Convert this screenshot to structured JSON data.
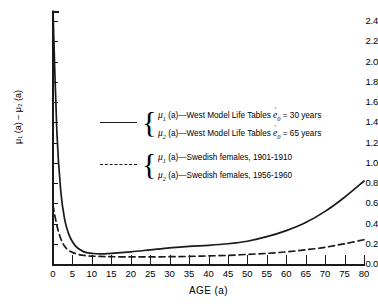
{
  "chart_data": {
    "type": "line",
    "title": "",
    "xlabel": "AGE (a)",
    "ylabel": "μ₁ (a) – μ₂ (a)",
    "xlim": [
      0,
      80
    ],
    "ylim": [
      0.0,
      2.5
    ],
    "grid": false,
    "legend_position": "upper-center",
    "xticks": [
      "0",
      "5",
      "10",
      "15",
      "20",
      "25",
      "30",
      "35",
      "40",
      "45",
      "50",
      "55",
      "60",
      "65",
      "70",
      "75",
      "80"
    ],
    "yticks": [
      "0.0",
      "0.2",
      "0.4",
      "0.6",
      "0.8",
      "1.0",
      "1.2",
      "1.4",
      "1.6",
      "1.8",
      "2.0",
      "2.2",
      "2.4"
    ],
    "series": [
      {
        "name": "West Model Life Tables",
        "style": "solid",
        "x": [
          0,
          1,
          2,
          3,
          4,
          5,
          6,
          7,
          8,
          9,
          10,
          12,
          15,
          20,
          25,
          30,
          35,
          40,
          45,
          50,
          55,
          60,
          65,
          70,
          75,
          80
        ],
        "values": [
          2.5,
          1.3,
          0.72,
          0.44,
          0.3,
          0.22,
          0.17,
          0.14,
          0.12,
          0.11,
          0.105,
          0.1,
          0.105,
          0.12,
          0.14,
          0.16,
          0.175,
          0.185,
          0.2,
          0.225,
          0.27,
          0.33,
          0.41,
          0.52,
          0.66,
          0.82
        ]
      },
      {
        "name": "Swedish females",
        "style": "dashed",
        "x": [
          0,
          1,
          2,
          3,
          4,
          5,
          6,
          7,
          8,
          9,
          10,
          12,
          15,
          20,
          25,
          30,
          35,
          40,
          45,
          50,
          55,
          60,
          65,
          70,
          75,
          80
        ],
        "values": [
          0.58,
          0.38,
          0.25,
          0.175,
          0.135,
          0.115,
          0.1,
          0.09,
          0.085,
          0.08,
          0.078,
          0.075,
          0.072,
          0.07,
          0.07,
          0.072,
          0.075,
          0.08,
          0.085,
          0.095,
          0.105,
          0.12,
          0.14,
          0.165,
          0.2,
          0.24
        ]
      }
    ],
    "legend": [
      {
        "sample": "solid",
        "entries": [
          {
            "symbol": "μ",
            "sub": "1",
            "text": "(a)—West Model Life Tables",
            "param": "e",
            "param_sub": "0",
            "value": "= 30 years"
          },
          {
            "symbol": "μ",
            "sub": "2",
            "text": "(a)—West Model Life Tables",
            "param": "e",
            "param_sub": "0",
            "value": "= 65 years"
          }
        ]
      },
      {
        "sample": "dashed",
        "entries": [
          {
            "symbol": "μ",
            "sub": "1",
            "text": "(a)—Swedish females, 1901-1910",
            "param": "",
            "param_sub": "",
            "value": ""
          },
          {
            "symbol": "μ",
            "sub": "2",
            "text": "(a)—Swedish females, 1956-1960",
            "param": "",
            "param_sub": "",
            "value": ""
          }
        ]
      }
    ],
    "colors": {
      "line": "#1a1a1a",
      "background": "#ffffff"
    }
  }
}
